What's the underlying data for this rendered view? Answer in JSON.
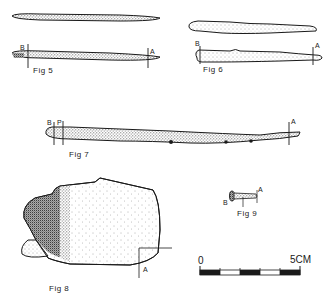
{
  "figures": {
    "fig5": {
      "label": "Fig 5",
      "marker_a": "A",
      "marker_b": "B"
    },
    "fig6": {
      "label": "Fig 6",
      "marker_a": "A",
      "marker_b": "B"
    },
    "fig7": {
      "label": "Fig 7",
      "marker_a": "A",
      "marker_b": "B",
      "marker_p": "P"
    },
    "fig8": {
      "label": "Fig 8",
      "marker_a": "A"
    },
    "fig9": {
      "label": "Fig 9",
      "marker_a": "A",
      "marker_b": "B"
    }
  },
  "scale_bar": {
    "start_label": "0",
    "end_label": "5CM",
    "segments": 5
  },
  "colors": {
    "ink": "#1a1a1a",
    "paper": "#ffffff",
    "stipple_light": "#d9d9d9",
    "stipple_dark": "#555555"
  }
}
